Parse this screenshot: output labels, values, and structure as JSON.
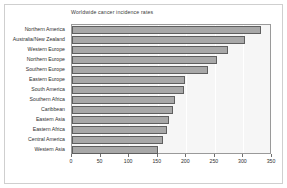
{
  "chart_data": {
    "type": "bar",
    "orientation": "horizontal",
    "title": "Worldwide cancer incidence rates",
    "xlabel": "",
    "ylabel": "",
    "xlim": [
      0,
      350
    ],
    "xticks": [
      0,
      50,
      100,
      150,
      200,
      250,
      300,
      350
    ],
    "grid": true,
    "legend": null,
    "categories": [
      "Northern America",
      "Australia/New Zealand",
      "Western Europe",
      "Northern Europe",
      "Southern Europe",
      "Eastern Europe",
      "South America",
      "Southern Africa",
      "Caribbean",
      "Eastern Asia",
      "Eastern Africa",
      "Central America",
      "Western Asia"
    ],
    "values": [
      330,
      303,
      273,
      254,
      238,
      198,
      196,
      180,
      177,
      170,
      167,
      159,
      151
    ],
    "colors": {
      "bar_fill": "#a8a8a8",
      "bar_edge": "#5f5f5f",
      "plot_background": "#f6f6f6",
      "gridline": "#ffffff",
      "axis": "#9a9a9a",
      "text": "#2f2f2f",
      "figure_background": "#ffffff"
    }
  }
}
